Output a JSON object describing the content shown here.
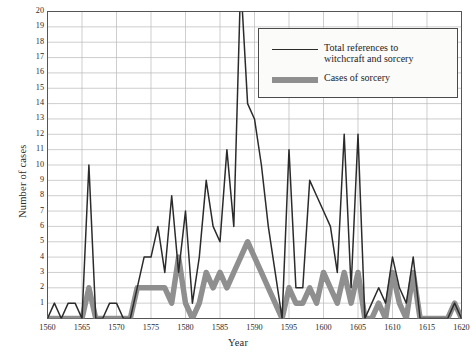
{
  "chart_data": {
    "type": "line",
    "title": "",
    "xlabel": "Year",
    "ylabel": "Number of cases",
    "xlim": [
      1560,
      1620
    ],
    "ylim": [
      0,
      20
    ],
    "grid": true,
    "legend_position": "top-right",
    "ytick_labels": [
      "1",
      "2",
      "3",
      "4",
      "5",
      "6",
      "7",
      "8",
      "9",
      "10",
      "11",
      "12",
      "13",
      "14",
      "15",
      "16",
      "17",
      "18",
      "19",
      "20"
    ],
    "ytick_values": [
      1,
      2,
      3,
      4,
      5,
      6,
      7,
      8,
      9,
      10,
      11,
      12,
      13,
      14,
      15,
      16,
      17,
      18,
      19,
      20
    ],
    "xtick_labels": [
      "1560",
      "1565",
      "1570",
      "1575",
      "1580",
      "1585",
      "1590",
      "1595",
      "1600",
      "1605",
      "1610",
      "1615",
      "1620"
    ],
    "xtick_values": [
      1560,
      1565,
      1570,
      1575,
      1580,
      1585,
      1590,
      1595,
      1600,
      1605,
      1610,
      1615,
      1620
    ],
    "x": [
      1560,
      1561,
      1562,
      1563,
      1564,
      1565,
      1566,
      1567,
      1568,
      1569,
      1570,
      1571,
      1572,
      1573,
      1574,
      1575,
      1576,
      1577,
      1578,
      1579,
      1580,
      1581,
      1582,
      1583,
      1584,
      1585,
      1586,
      1587,
      1588,
      1589,
      1590,
      1591,
      1592,
      1593,
      1594,
      1595,
      1596,
      1597,
      1598,
      1599,
      1600,
      1601,
      1602,
      1603,
      1604,
      1605,
      1606,
      1607,
      1608,
      1609,
      1610,
      1611,
      1612,
      1613,
      1614,
      1615,
      1616,
      1617,
      1618,
      1619,
      1620
    ],
    "series": [
      {
        "name": "Total references to\nwitchcraft and sorcery",
        "color": "#2b2b2b",
        "width": 1.5,
        "values": [
          0,
          1,
          0,
          1,
          1,
          0,
          10,
          0,
          0,
          1,
          1,
          0,
          0,
          2,
          4,
          4,
          6,
          3,
          8,
          3,
          7,
          1,
          4,
          9,
          6,
          5,
          11,
          6,
          22,
          14,
          13,
          10,
          6,
          3,
          0,
          11,
          2,
          2,
          9,
          8,
          7,
          6,
          3,
          12,
          2,
          12,
          0,
          1,
          2,
          1,
          4,
          2,
          1,
          4,
          0,
          0,
          0,
          0,
          0,
          1,
          0
        ]
      },
      {
        "name": "Cases of sorcery",
        "color": "#8f8f8f",
        "width": 5.5,
        "values": [
          0,
          0,
          0,
          0,
          0,
          0,
          2,
          0,
          0,
          0,
          0,
          0,
          0,
          2,
          2,
          2,
          2,
          2,
          1,
          4,
          1,
          0,
          1,
          3,
          2,
          3,
          2,
          3,
          4,
          5,
          4,
          3,
          2,
          1,
          0,
          2,
          1,
          1,
          2,
          1,
          3,
          2,
          1,
          3,
          1,
          3,
          0,
          0,
          1,
          0,
          3,
          1,
          0,
          3,
          0,
          0,
          0,
          0,
          0,
          1,
          0
        ]
      }
    ]
  },
  "legend": {
    "entries": [
      {
        "label": "Total references to\nwitchcraft and sorcery",
        "style": "thin-line"
      },
      {
        "label": "Cases of sorcery",
        "style": "thick-line"
      }
    ]
  },
  "axis_titles": {
    "y": "Number of cases",
    "x": "Year"
  },
  "colors": {
    "total_line": "#2b2b2b",
    "sorcery_line": "#8f8f8f",
    "grid": "#b9b9b9",
    "frame": "#555555",
    "background": "#ffffff"
  }
}
